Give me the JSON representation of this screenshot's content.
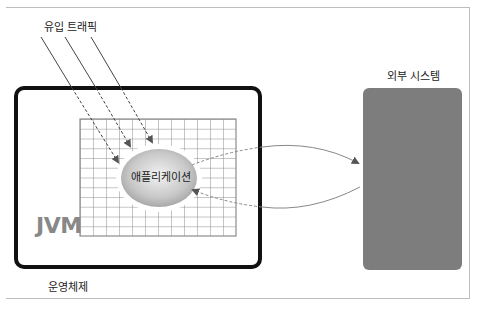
{
  "diagram": {
    "inbound_label": "유입 트래픽",
    "external_label": "외부 시스템",
    "os_label": "운영체제",
    "jvm_label": "JVM",
    "app_label": "애플리케이션",
    "colors": {
      "os_border": "#111111",
      "external_fill": "#7d7d7d",
      "grid": "#8c8c8c",
      "jvm_text": "#888888",
      "arrow": "#888888",
      "app_fill_center": "#f2f2f2",
      "app_fill_edge": "#a8a8a8"
    },
    "edges": [
      {
        "from": "inbound-traffic",
        "to": "application",
        "style": "solid-then-dashed"
      },
      {
        "from": "inbound-traffic",
        "to": "application",
        "style": "solid-then-dashed"
      },
      {
        "from": "inbound-traffic",
        "to": "application",
        "style": "solid-then-dashed"
      },
      {
        "from": "application",
        "to": "external-system",
        "style": "dashed-then-solid"
      },
      {
        "from": "external-system",
        "to": "application",
        "style": "solid-then-dashed"
      }
    ]
  }
}
